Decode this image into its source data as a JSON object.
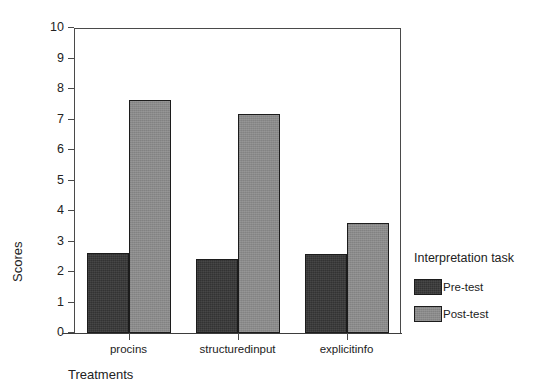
{
  "chart_data": {
    "type": "bar",
    "title": "",
    "xlabel": "Treatments",
    "ylabel": "Scores",
    "categories": [
      "procins",
      "structuredinput",
      "explicitinfo"
    ],
    "series": [
      {
        "name": "Pre-test",
        "color": "#333333",
        "values": [
          2.63,
          2.42,
          2.58
        ]
      },
      {
        "name": "Post-test",
        "color": "#8a8a8a",
        "values": [
          7.65,
          7.18,
          3.6
        ]
      }
    ],
    "ylim": [
      0,
      10
    ],
    "ytick_labels": [
      "10",
      "9",
      "8",
      "7",
      "6",
      "5",
      "4",
      "3",
      "2",
      "1",
      "0"
    ],
    "ytick_values": [
      10,
      9,
      8,
      7,
      6,
      5,
      4,
      3,
      2,
      1,
      0
    ],
    "grid": false,
    "legend": {
      "title": "Interpretation task",
      "position": "right",
      "entries": [
        {
          "label": "Pre-test",
          "color": "#333333"
        },
        {
          "label": "Post-test",
          "color": "#8a8a8a"
        }
      ]
    }
  }
}
